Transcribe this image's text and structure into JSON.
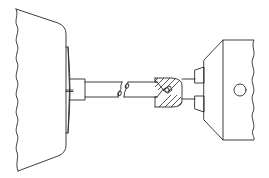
{
  "diagram": {
    "type": "technical-line-drawing",
    "colors": {
      "stroke": "#2a2a2a",
      "background": "#ffffff"
    },
    "components": [
      {
        "id": "left-housing",
        "label": ""
      },
      {
        "id": "left-flange-disc",
        "label": ""
      },
      {
        "id": "left-hub",
        "label": ""
      },
      {
        "id": "shaft",
        "label": ""
      },
      {
        "id": "break-marks",
        "label": ""
      },
      {
        "id": "sectioned-coupling",
        "label": ""
      },
      {
        "id": "right-flange",
        "label": ""
      },
      {
        "id": "right-housing",
        "label": ""
      },
      {
        "id": "right-hole",
        "label": ""
      }
    ]
  }
}
